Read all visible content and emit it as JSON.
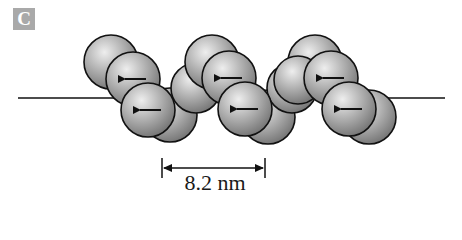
{
  "figure": {
    "panel_label": "C",
    "measurement": {
      "label": "8.2 nm",
      "x_start": 162,
      "x_end": 265,
      "y": 168
    },
    "axis_line": {
      "y": 98,
      "x_start": 18,
      "x_end": 445
    },
    "colors": {
      "sphere_fill": "#9a9a9a",
      "sphere_highlight": "#e6e6e6",
      "stroke": "#111111",
      "label_bg": "#a9a9a9"
    },
    "units": [
      {
        "back": [
          {
            "cx": 111,
            "cy": 62,
            "r": 27
          },
          {
            "cx": 170,
            "cy": 115,
            "r": 27
          },
          {
            "cx": 196,
            "cy": 88,
            "r": 25
          }
        ],
        "front": [
          {
            "cx": 133,
            "cy": 79,
            "r": 27,
            "arrow": true
          },
          {
            "cx": 148,
            "cy": 110,
            "r": 27,
            "arrow": true
          }
        ]
      },
      {
        "back": [
          {
            "cx": 212,
            "cy": 62,
            "r": 27
          },
          {
            "cx": 268,
            "cy": 117,
            "r": 27
          },
          {
            "cx": 292,
            "cy": 88,
            "r": 25
          }
        ],
        "front": [
          {
            "cx": 229,
            "cy": 78,
            "r": 27,
            "arrow": true
          },
          {
            "cx": 245,
            "cy": 109,
            "r": 27,
            "arrow": true
          }
        ]
      },
      {
        "back": [
          {
            "cx": 315,
            "cy": 62,
            "r": 27
          },
          {
            "cx": 369,
            "cy": 117,
            "r": 27
          },
          {
            "cx": 298,
            "cy": 80,
            "r": 24
          }
        ],
        "front": [
          {
            "cx": 331,
            "cy": 78,
            "r": 27,
            "arrow": true
          },
          {
            "cx": 349,
            "cy": 109,
            "r": 27,
            "arrow": true
          }
        ]
      }
    ],
    "arrow_direction": "left"
  }
}
